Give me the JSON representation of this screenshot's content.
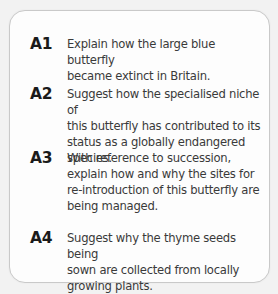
{
  "questions": [
    {
      "label": "A1",
      "lines": [
        "Explain how the large blue butterfly",
        "became extinct in Britain."
      ],
      "text": "Explain how the large blue butterfly became extinct in Britain."
    },
    {
      "label": "A2",
      "lines": [
        "Suggest how the specialised niche of",
        "this butterfly has contributed to its",
        "status as a globally endangered",
        "species."
      ],
      "text": "Suggest how the specialised niche of this butterfly has contributed to its status as a globally endangered species."
    },
    {
      "label": "A3",
      "lines": [
        "With reference to succession,",
        "explain how and why the sites for",
        "re-introduction of this butterfly are",
        "being managed."
      ],
      "text": "With reference to succession, explain how and why the sites for re-introduction of this butterfly are being managed."
    },
    {
      "label": "A4",
      "lines": [
        "Suggest why the thyme seeds being",
        "sown are collected from locally",
        "growing plants."
      ],
      "text": "Suggest why the thyme seeds being sown are collected from locally growing plants."
    }
  ],
  "colors": {
    "background": "#f2f2f2",
    "box_fill": "#fdfdfd",
    "box_border": "#c9c9c9",
    "label": "#1a1a1a",
    "text": "#3a3a3a"
  }
}
